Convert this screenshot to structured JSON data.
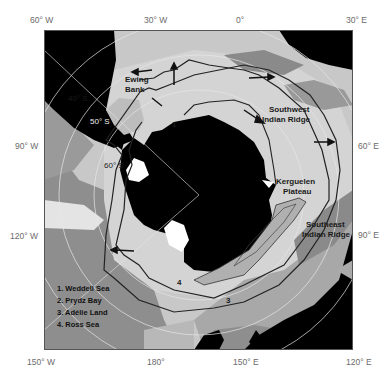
{
  "map": {
    "type": "polar stereographic map of Southern Ocean",
    "colors": {
      "land": "#000000",
      "ice_shelf": "#ffffff",
      "light_seafloor": "#d8d8d8",
      "mid_seafloor": "#b4b4b4",
      "dark_seafloor": "#8c8c8c",
      "front_line": "#222222"
    },
    "axis_labels": {
      "top": [
        "60° W",
        "30° W",
        "0°",
        "30° E"
      ],
      "left": [
        "90° W",
        "120° W"
      ],
      "right": [
        "60° E",
        "90° E"
      ],
      "bottom": [
        "150° W",
        "180°",
        "150° E",
        "120° E"
      ]
    },
    "latitude_labels": [
      "40° S",
      "50° S",
      "60° S"
    ],
    "feature_labels": {
      "ewing_bank": "Ewing\nBank",
      "ewing_line1": "Ewing",
      "ewing_line2": "Bank",
      "sw_ridge_line1": "Southwest",
      "sw_ridge_line2": "Indian Ridge",
      "kerguelen_line1": "Kerguelen",
      "kerguelen_line2": "Plateau",
      "se_ridge_line1": "Southeast",
      "se_ridge_line2": "Indian Ridge"
    },
    "site_markers": [
      "1",
      "2",
      "3",
      "4"
    ],
    "legend": {
      "items": [
        "1. Weddell Sea",
        "2. Prydz Bay",
        "3. Adélie Land",
        "4. Ross Sea"
      ]
    }
  }
}
